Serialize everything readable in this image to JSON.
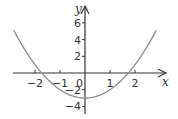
{
  "chart_data": {
    "type": "line",
    "title": "",
    "function": "y = x^2 - 3",
    "xlabel": "x",
    "ylabel": "y",
    "xlim": [
      -2.85,
      2.85
    ],
    "ylim": [
      -4.5,
      7
    ],
    "grid": false,
    "legend": null,
    "x_ticks": [
      -2,
      -1,
      0,
      1,
      2
    ],
    "x_tick_labels": [
      "−2",
      "−1",
      "0",
      "1",
      "2"
    ],
    "y_ticks": [
      -4,
      -2,
      2,
      4,
      6
    ],
    "y_tick_labels": [
      "−4",
      "−2",
      "2",
      "4",
      "6"
    ],
    "origin_label": "0",
    "series": [
      {
        "name": "parabola",
        "color": "#8a8a8a",
        "x": [
          -2.8,
          -2.5,
          -2,
          -1.5,
          -1,
          -0.5,
          0,
          0.5,
          1,
          1.5,
          2,
          2.5,
          2.8
        ],
        "y": [
          4.84,
          3.25,
          1,
          -0.75,
          -2,
          -2.75,
          -3,
          -2.75,
          -2,
          -0.75,
          1,
          3.25,
          4.84
        ]
      }
    ],
    "roots": [
      -1.73,
      1.73
    ],
    "vertex": [
      0,
      -3
    ]
  },
  "colors": {
    "axis": "#333333",
    "curve": "#8a8a8a"
  }
}
